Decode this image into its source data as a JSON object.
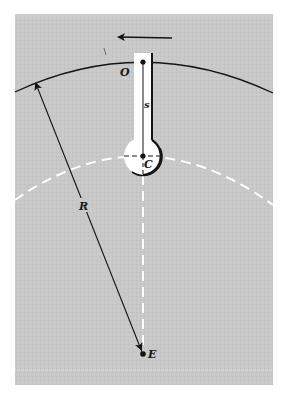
{
  "figure": {
    "background_color": "#ffffff",
    "panel_color": "#c9c9c9",
    "ink_color": "#141414",
    "dash_color": "#ffffff",
    "labels": {
      "origin": "O",
      "arm_length": "s",
      "center": "C",
      "earth_center": "E",
      "radius": "R"
    },
    "motion_arrow": {
      "direction": "left"
    }
  }
}
